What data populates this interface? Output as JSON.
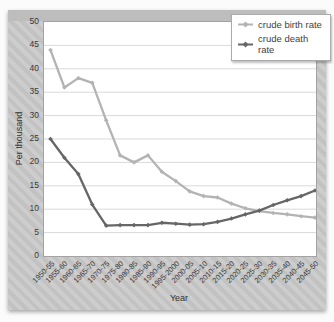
{
  "chart": {
    "colors": {
      "birth_line": "#b3b3b3",
      "death_line": "#666666",
      "gridline": "#d9d9d9",
      "plot_border": "#a3a3a3",
      "surround_stripe_light": "#cdcdcd",
      "surround_stripe_dark": "#c2c2c2",
      "top_strip": "#bdbdbd",
      "text": "#3a3a3a",
      "legend_background": "#ffffff"
    },
    "chart_data": {
      "type": "line",
      "title": "",
      "xlabel": "Year",
      "ylabel": "Per thousand",
      "ylim": [
        0,
        50
      ],
      "ytick_step": 5,
      "grid": "horizontal",
      "legend_position": "top-right",
      "categories": [
        "1950-55",
        "1955-60",
        "1960-65",
        "1965-70",
        "1970-75",
        "1975-80",
        "1980-85",
        "1985-90",
        "1990-95",
        "1995-2000",
        "2000-05",
        "2005-10",
        "2010-15",
        "2015-20",
        "2020-25",
        "2025-30",
        "2030-35",
        "2035-40",
        "2040-45",
        "2045-50"
      ],
      "series": [
        {
          "name": "crude birth rate",
          "color": "#b3b3b3",
          "values": [
            44,
            36,
            38,
            37,
            29,
            21.5,
            20,
            21.5,
            18,
            16,
            13.8,
            12.8,
            12.5,
            11.2,
            10.2,
            9.6,
            9.2,
            8.9,
            8.5,
            8.2
          ]
        },
        {
          "name": "crude death rate",
          "color": "#666666",
          "values": [
            25,
            21,
            17.5,
            11,
            6.5,
            6.6,
            6.6,
            6.6,
            7.1,
            6.9,
            6.7,
            6.8,
            7.3,
            8,
            8.9,
            9.7,
            10.9,
            11.9,
            12.8,
            14
          ]
        }
      ]
    }
  }
}
